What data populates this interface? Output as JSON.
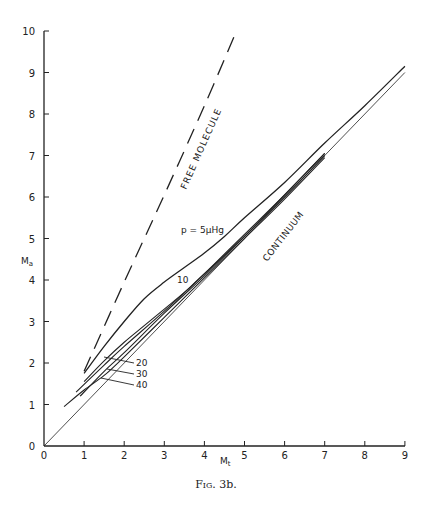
{
  "figure": {
    "caption_prefix": "Fig.",
    "caption_number": "3b."
  },
  "chart_data": {
    "type": "line",
    "title": "",
    "xlabel": "M_t",
    "ylabel": "M_a",
    "xlim": [
      0,
      9
    ],
    "ylim": [
      0,
      10
    ],
    "x_ticks": [
      "0",
      "1",
      "2",
      "3",
      "4",
      "5",
      "6",
      "7",
      "8",
      "9"
    ],
    "y_ticks": [
      "0",
      "1",
      "2",
      "3",
      "4",
      "5",
      "6",
      "7",
      "8",
      "9",
      "10"
    ],
    "grid": false,
    "legend": "none (inline labels)",
    "annotations": [
      "FREE MOLECULE",
      "CONTINUUM",
      "p = 5μHg",
      "10",
      "20",
      "30",
      "40"
    ],
    "series": [
      {
        "name": "Free molecule",
        "style": "dashed",
        "points": [
          [
            1.0,
            1.8
          ],
          [
            2.0,
            3.95
          ],
          [
            3.0,
            6.05
          ],
          [
            4.0,
            8.2
          ],
          [
            4.8,
            10.0
          ]
        ]
      },
      {
        "name": "Continuum (Ma = Mt)",
        "style": "thin",
        "points": [
          [
            0,
            0
          ],
          [
            9,
            9
          ]
        ]
      },
      {
        "name": "p = 5 μHg",
        "style": "solid",
        "points": [
          [
            1.0,
            1.75
          ],
          [
            1.5,
            2.4
          ],
          [
            2.0,
            3.0
          ],
          [
            2.5,
            3.55
          ],
          [
            3.0,
            3.95
          ],
          [
            3.5,
            4.3
          ],
          [
            4.0,
            4.65
          ],
          [
            4.5,
            5.05
          ],
          [
            5.0,
            5.5
          ],
          [
            6.0,
            6.35
          ],
          [
            7.0,
            7.3
          ],
          [
            8.0,
            8.2
          ],
          [
            9.0,
            9.15
          ]
        ]
      },
      {
        "name": "p = 10 μHg",
        "style": "solid",
        "points": [
          [
            1.0,
            1.55
          ],
          [
            1.5,
            2.05
          ],
          [
            2.0,
            2.5
          ],
          [
            2.5,
            2.9
          ],
          [
            3.0,
            3.3
          ],
          [
            3.5,
            3.7
          ],
          [
            4.0,
            4.15
          ],
          [
            5.0,
            5.1
          ],
          [
            6.0,
            6.05
          ],
          [
            7.0,
            7.05
          ]
        ]
      },
      {
        "name": "p = 20 μHg",
        "style": "solid",
        "points": [
          [
            0.8,
            1.3
          ],
          [
            1.5,
            1.95
          ],
          [
            2.0,
            2.4
          ],
          [
            3.0,
            3.25
          ],
          [
            4.0,
            4.15
          ],
          [
            5.0,
            5.05
          ],
          [
            6.0,
            6.05
          ],
          [
            7.0,
            7.05
          ]
        ]
      },
      {
        "name": "p = 30 μHg",
        "style": "solid",
        "points": [
          [
            0.9,
            1.2
          ],
          [
            1.5,
            1.8
          ],
          [
            2.0,
            2.25
          ],
          [
            3.0,
            3.2
          ],
          [
            4.0,
            4.1
          ],
          [
            5.0,
            5.05
          ],
          [
            6.0,
            6.0
          ],
          [
            7.0,
            7.0
          ]
        ]
      },
      {
        "name": "p = 40 μHg",
        "style": "solid",
        "points": [
          [
            0.5,
            0.95
          ],
          [
            1.0,
            1.35
          ],
          [
            1.5,
            1.7
          ],
          [
            2.0,
            2.15
          ],
          [
            3.0,
            3.1
          ],
          [
            4.0,
            4.05
          ],
          [
            5.0,
            5.0
          ],
          [
            6.0,
            5.95
          ],
          [
            7.0,
            6.95
          ]
        ]
      }
    ]
  },
  "labels": {
    "free_molecule": "FREE MOLECULE",
    "continuum": "CONTINUUM",
    "p5": "p = 5μHg",
    "p10": "10",
    "p20": "20",
    "p30": "30",
    "p40": "40",
    "xlabel_main": "M",
    "xlabel_sub": "t",
    "ylabel_main": "M",
    "ylabel_sub": "a"
  }
}
